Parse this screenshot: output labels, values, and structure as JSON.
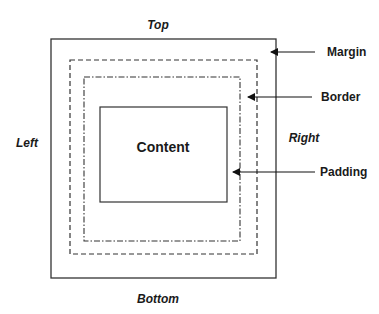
{
  "diagram": {
    "sides": {
      "top": "Top",
      "bottom": "Bottom",
      "left": "Left",
      "right": "Right"
    },
    "content_label": "Content",
    "callouts": [
      {
        "label": "Margin",
        "line_style": "solid"
      },
      {
        "label": "Border",
        "line_style": "dashed"
      },
      {
        "label": "Padding",
        "line_style": "dash-dot"
      }
    ],
    "colors": {
      "stroke": "#333333",
      "text": "#1a1a1a",
      "background": "#ffffff"
    }
  }
}
